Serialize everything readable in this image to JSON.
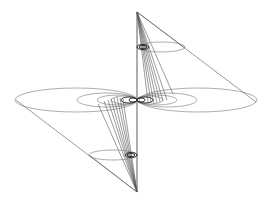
{
  "diagram": {
    "title": "",
    "stroke_color": "#555555",
    "background": "#ffffff",
    "axis": {
      "x": 137,
      "y_top": 12,
      "y_bottom": 192
    },
    "center": {
      "x": 137,
      "y": 100
    },
    "upper_apex": {
      "x": 137,
      "y": 12
    },
    "lower_apex": {
      "x": 137,
      "y": 192
    },
    "large_ellipses": [
      {
        "side": "left",
        "cx": 76,
        "cy": 100,
        "rx": 61,
        "ry": 12
      },
      {
        "side": "right",
        "cx": 198,
        "cy": 100,
        "rx": 59,
        "ry": 12
      }
    ],
    "nested_ellipses_left": [
      {
        "cx": 107,
        "cy": 100,
        "rx": 30,
        "ry": 7
      },
      {
        "cx": 117,
        "cy": 100,
        "rx": 20,
        "ry": 5
      },
      {
        "cx": 124,
        "cy": 100,
        "rx": 13,
        "ry": 4
      },
      {
        "cx": 129,
        "cy": 100,
        "rx": 8,
        "ry": 3
      }
    ],
    "nested_ellipses_right": [
      {
        "cx": 167,
        "cy": 100,
        "rx": 30,
        "ry": 7
      },
      {
        "cx": 157,
        "cy": 100,
        "rx": 20,
        "ry": 5
      },
      {
        "cx": 150,
        "cy": 100,
        "rx": 13,
        "ry": 4
      },
      {
        "cx": 145,
        "cy": 100,
        "rx": 8,
        "ry": 3
      }
    ],
    "upper_small_ellipse": {
      "cx": 161,
      "cy": 47,
      "rx": 24,
      "ry": 5
    },
    "upper_tiny_ellipse": {
      "cx": 143,
      "cy": 47,
      "rx": 6,
      "ry": 2.5
    },
    "lower_small_ellipse": {
      "cx": 113,
      "cy": 155,
      "rx": 24,
      "ry": 5
    },
    "lower_tiny_ellipse": {
      "cx": 131,
      "cy": 155,
      "rx": 6,
      "ry": 2.5
    }
  }
}
